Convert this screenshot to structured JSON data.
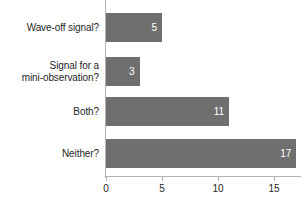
{
  "chart_data": {
    "type": "bar",
    "orientation": "horizontal",
    "title": "",
    "xlabel": "",
    "ylabel": "",
    "categories": [
      "Wave-off signal?",
      "Signal for a mini-observation?",
      "Both?",
      "Neither?"
    ],
    "category_lines": [
      [
        "Wave-off signal?"
      ],
      [
        "Signal for a",
        "mini-observation?"
      ],
      [
        "Both?"
      ],
      [
        "Neither?"
      ]
    ],
    "values": [
      5,
      3,
      11,
      17
    ],
    "value_labels": [
      "5",
      "3",
      "11",
      "17"
    ],
    "xlim": [
      0,
      17.75
    ],
    "xticks": [
      0,
      5,
      10,
      15
    ],
    "xtick_labels": [
      "0",
      "5",
      "10",
      "15"
    ],
    "grid": false,
    "legend": null,
    "colors": {
      "bar_fill": "#6f6f6f",
      "bar_value_text": "#ffffff",
      "category_text": "#262626",
      "tick_text": "#262626",
      "axis_line": "#b3b3b3",
      "background": "#ffffff"
    }
  }
}
